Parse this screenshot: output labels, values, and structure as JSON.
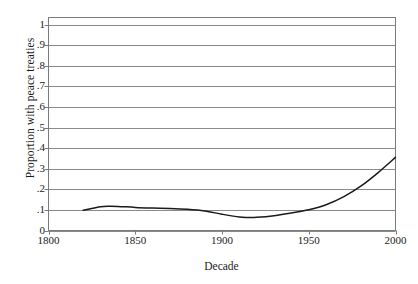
{
  "chart_data": {
    "type": "line",
    "title": "",
    "xlabel": "Decade",
    "ylabel": "Proportion with peace treaties",
    "xlim": [
      1800,
      2000
    ],
    "ylim": [
      0,
      1.0
    ],
    "grid": true,
    "legend": null,
    "xticks": [
      "1800",
      "1850",
      "1900",
      "1950",
      "2000"
    ],
    "xtick_values": [
      1800,
      1850,
      1900,
      1950,
      2000
    ],
    "yticks": [
      "0",
      ".1",
      ".2",
      ".3",
      ".4",
      ".5",
      ".6",
      ".7",
      ".8",
      ".9",
      "1"
    ],
    "ytick_values": [
      0,
      0.1,
      0.2,
      0.3,
      0.4,
      0.5,
      0.6,
      0.7,
      0.8,
      0.9,
      1.0
    ],
    "series": [
      {
        "name": "Proportion with peace treaties",
        "color": "#1a1a1a",
        "x": [
          1820,
          1830,
          1835,
          1840,
          1850,
          1860,
          1870,
          1880,
          1890,
          1900,
          1910,
          1915,
          1920,
          1930,
          1940,
          1950,
          1960,
          1970,
          1980,
          1990,
          2000
        ],
        "values": [
          0.098,
          0.115,
          0.118,
          0.117,
          0.112,
          0.109,
          0.107,
          0.103,
          0.095,
          0.079,
          0.065,
          0.063,
          0.064,
          0.072,
          0.085,
          0.101,
          0.125,
          0.163,
          0.215,
          0.281,
          0.355
        ]
      }
    ]
  },
  "axis": {
    "ylabel_text": "Proportion with peace treaties",
    "xlabel_text": "Decade"
  },
  "style": {
    "grid_color": "#8a8a8a",
    "frame_color": "#7a7a7a",
    "line_color": "#1a1a1a",
    "background": "#ffffff"
  }
}
